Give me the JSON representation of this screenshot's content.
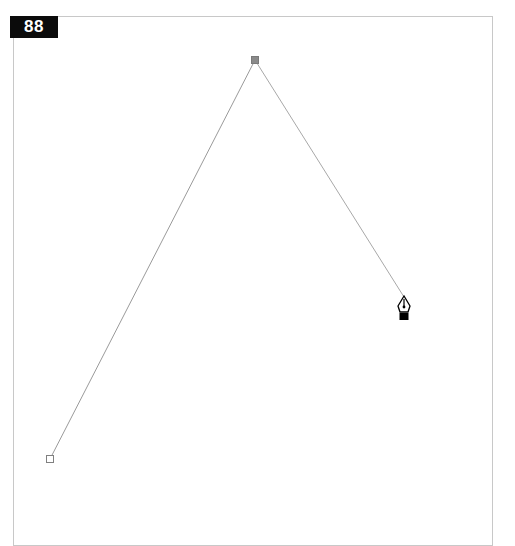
{
  "step_badge": {
    "label": "88"
  },
  "canvas": {
    "tool": "pen-tool",
    "path": {
      "stroke_color": "#9a9a9a",
      "anchors": [
        {
          "x": 50,
          "y": 459,
          "style": "hollow"
        },
        {
          "x": 255,
          "y": 60,
          "style": "filled"
        }
      ],
      "rubber_band_end": {
        "x": 404,
        "y": 297
      }
    },
    "cursor": {
      "icon": "pen-cursor-icon",
      "x": 404,
      "y": 296
    }
  }
}
